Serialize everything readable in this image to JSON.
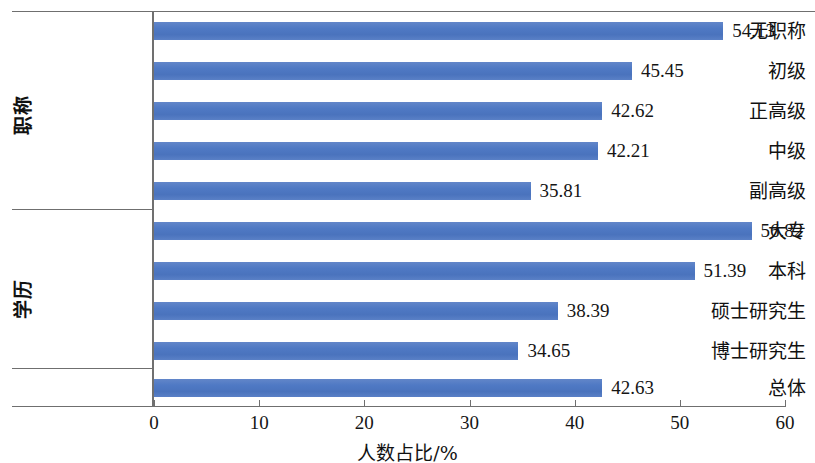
{
  "chart_data": {
    "type": "bar",
    "orientation": "horizontal",
    "title": "",
    "xlabel": "人数占比/%",
    "ylabel": "",
    "xlim": [
      0,
      60
    ],
    "xticks": [
      0,
      10,
      20,
      30,
      40,
      50,
      60
    ],
    "grid": false,
    "legend": "none",
    "bar_color": "#4F79C4",
    "axis_color": "#6F6F6F",
    "label_color": "#151515",
    "groups": [
      {
        "name": "职称",
        "categories": [
          "无职称",
          "初级",
          "正高级",
          "中级",
          "副高级"
        ],
        "values": [
          54.13,
          45.45,
          42.62,
          42.21,
          35.81
        ]
      },
      {
        "name": "学历",
        "categories": [
          "大专",
          "本科",
          "硕士研究生",
          "博士研究生"
        ],
        "values": [
          56.82,
          51.39,
          38.39,
          34.65
        ]
      },
      {
        "name": "",
        "categories": [
          "总体"
        ],
        "values": [
          42.63
        ]
      }
    ],
    "categories": [
      "无职称",
      "初级",
      "正高级",
      "中级",
      "副高级",
      "大专",
      "本科",
      "硕士研究生",
      "博士研究生",
      "总体"
    ],
    "values": [
      54.13,
      45.45,
      42.62,
      42.21,
      35.81,
      56.82,
      51.39,
      38.39,
      34.65,
      42.63
    ],
    "value_labels": [
      "54.13",
      "45.45",
      "42.62",
      "42.21",
      "35.81",
      "56.82",
      "51.39",
      "38.39",
      "34.65",
      "42.63"
    ],
    "xtick_labels": [
      "0",
      "10",
      "20",
      "30",
      "40",
      "50",
      "60"
    ],
    "group_labels": [
      "职称",
      "学历"
    ]
  }
}
